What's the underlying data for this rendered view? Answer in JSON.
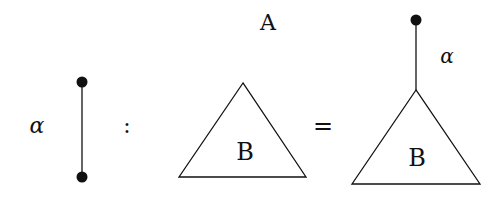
{
  "diagram": {
    "edge": {
      "label": "α",
      "top_node": "filled-dot",
      "bottom_node": "filled-dot"
    },
    "colon": ":",
    "left_tree": {
      "label": "B"
    },
    "equals": "=",
    "right_tree": {
      "root_label": "A",
      "edge_label": "α",
      "subtree_label": "B"
    }
  },
  "colors": {
    "ink": "#111111",
    "background": "#ffffff"
  }
}
